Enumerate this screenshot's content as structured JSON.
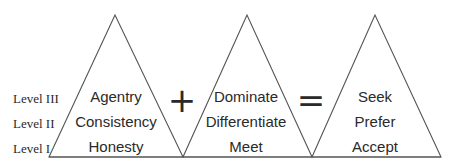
{
  "levels": [
    "Level III",
    "Level II",
    "Level I"
  ],
  "triangles": [
    {
      "words": [
        "Agentry",
        "Consistency",
        "Honesty"
      ]
    },
    {
      "words": [
        "Dominate",
        "Differentiate",
        "Meet"
      ]
    },
    {
      "words": [
        "Seek",
        "Prefer",
        "Accept"
      ]
    }
  ],
  "operators": [
    "+",
    "="
  ]
}
